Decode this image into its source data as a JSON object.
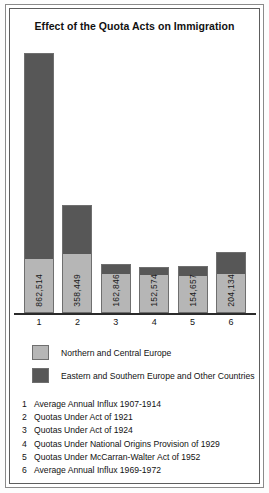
{
  "chart_data": {
    "type": "bar",
    "title": "Effect of the Quota Acts on Immigration",
    "xlabel": "",
    "ylabel": "",
    "grid": false,
    "stacked": true,
    "legend_position": "below-plot",
    "categories": [
      "1",
      "2",
      "3",
      "4",
      "5",
      "6"
    ],
    "category_descriptions": [
      "Average Annual Influx 1907-1914",
      "Quotas Under Act of 1921",
      "Quotas Under Act of 1924",
      "Quotas Under National Origins Provision of 1929",
      "Quotas Under McCarran-Walter Act of 1952",
      "Average Annual Influx 1969-1972"
    ],
    "totals": [
      862514,
      358449,
      162846,
      152574,
      154657,
      204134
    ],
    "total_labels": [
      "862,514",
      "358,449",
      "162,846",
      "152,574",
      "154,657",
      "204,134"
    ],
    "ylim": [
      0,
      900000
    ],
    "series": [
      {
        "name": "Northern and Central Europe",
        "color": "#b6b6b6",
        "values": [
          176000,
          198000,
          131000,
          127000,
          126000,
          129000
        ]
      },
      {
        "name": "Eastern and Southern Europe and Other Countries",
        "color": "#575757",
        "values": [
          686514,
          160449,
          31846,
          25574,
          28657,
          75134
        ]
      }
    ]
  },
  "legend": {
    "items": [
      {
        "label": "Northern and Central Europe",
        "swatch": "light"
      },
      {
        "label": "Eastern and Southern Europe and Other Countries",
        "swatch": "dark"
      }
    ]
  },
  "footnotes": {
    "items": [
      {
        "num": "1",
        "text": "Average Annual Influx 1907-1914"
      },
      {
        "num": "2",
        "text": "Quotas Under Act of 1921"
      },
      {
        "num": "3",
        "text": "Quotas Under Act of 1924"
      },
      {
        "num": "4",
        "text": "Quotas Under National Origins Provision of 1929"
      },
      {
        "num": "5",
        "text": "Quotas Under McCarran-Walter Act of 1952"
      },
      {
        "num": "6",
        "text": "Average Annual Influx 1969-1972"
      }
    ]
  }
}
